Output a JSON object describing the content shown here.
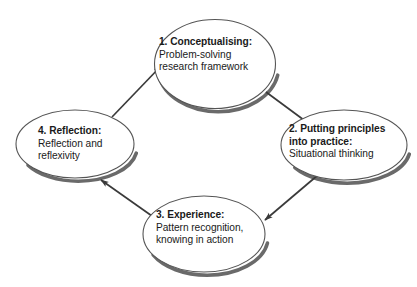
{
  "diagram": {
    "type": "cycle",
    "background_color": "#ffffff",
    "ellipse_fill": "#ffffff",
    "ellipse_stroke": "#555555",
    "shadow_color": "#6a6a6a",
    "arrow_color": "#3a3a3a",
    "text_color": "#1a1a1a",
    "nodes": [
      {
        "id": "conceptualising",
        "title": "1. Conceptualising:",
        "lines": [
          "Problem-solving",
          "research framework"
        ],
        "position": "top"
      },
      {
        "id": "putting-principles-into-practice",
        "title": "2. Putting principles",
        "title_line2": "into practice:",
        "lines": [
          "Situational thinking"
        ],
        "position": "right"
      },
      {
        "id": "experience",
        "title": "3. Experience:",
        "lines": [
          "Pattern recognition,",
          "knowing in action"
        ],
        "position": "bottom"
      },
      {
        "id": "reflection",
        "title": "4. Reflection:",
        "lines": [
          "Reflection and",
          "reflexivity"
        ],
        "position": "left"
      }
    ],
    "arrows": [
      {
        "from": "reflection",
        "to": "conceptualising",
        "direction": "up-right"
      },
      {
        "from": "conceptualising",
        "to": "putting-principles-into-practice",
        "direction": "down-right"
      },
      {
        "from": "putting-principles-into-practice",
        "to": "experience",
        "direction": "down-left"
      },
      {
        "from": "experience",
        "to": "reflection",
        "direction": "up-left"
      }
    ]
  }
}
